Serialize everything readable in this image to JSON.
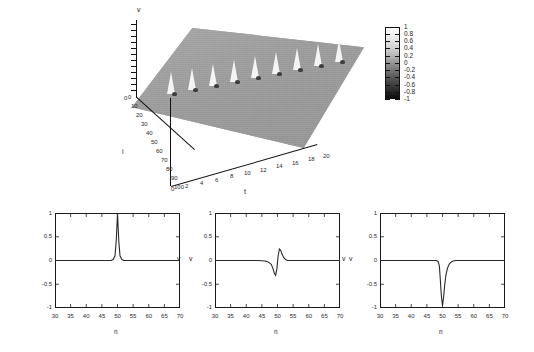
{
  "figure": {
    "kind": "soliton-simulation-figure",
    "background": "#ffffff",
    "line_color": "#2a2a2a",
    "surface_color": "#9e9e9e",
    "spike_color": "#f4f4f4"
  },
  "surface_plot": {
    "zlabel": "v",
    "xlabel": "t",
    "ylabel": "i",
    "t_ticks": [
      "0",
      "2",
      "4",
      "6",
      "8",
      "10",
      "12",
      "14",
      "16",
      "18",
      "20"
    ],
    "i_ticks": [
      "0",
      "10",
      "20",
      "30",
      "40",
      "50",
      "60",
      "70",
      "80",
      "90",
      "100"
    ],
    "v_origin_tick": "0",
    "spike_count": 9,
    "zero_label": "0"
  },
  "colorbar": {
    "labels": [
      "1",
      "0.8",
      "0.6",
      "0.4",
      "0.2",
      "0",
      "-0.2",
      "-0.4",
      "-0.6",
      "-0.8",
      "-1"
    ],
    "max": 1,
    "min": -1,
    "top_color": "#ffffff",
    "bottom_color": "#0d0d0d"
  },
  "chart_data": [
    {
      "type": "line",
      "title": "",
      "xlabel": "n",
      "ylabel": "v",
      "xlim": [
        30,
        70
      ],
      "ylim": [
        -1,
        1
      ],
      "xticks": [
        "30",
        "35",
        "40",
        "45",
        "50",
        "55",
        "60",
        "65",
        "70"
      ],
      "yticks": [
        "1",
        "0.5",
        "0",
        "-0.5",
        "-1"
      ],
      "grid": false,
      "legend": "none",
      "series": [
        {
          "name": "v(n)",
          "x": [
            30,
            32,
            34,
            36,
            38,
            40,
            42,
            44,
            45,
            46,
            47,
            48,
            48.6,
            49.2,
            49.6,
            50,
            50.4,
            50.8,
            51.4,
            52,
            53,
            54,
            56,
            58,
            60,
            62,
            64,
            66,
            68,
            70
          ],
          "values": [
            0,
            0,
            0,
            0,
            0,
            0,
            0,
            0,
            0,
            0,
            0,
            0,
            0.02,
            0.1,
            0.42,
            1.0,
            0.42,
            0.1,
            0.02,
            0,
            0,
            0,
            0,
            0,
            0,
            0,
            0,
            0,
            0,
            0
          ]
        }
      ]
    },
    {
      "type": "line",
      "title": "",
      "xlabel": "n",
      "ylabel": "v",
      "xlim": [
        30,
        70
      ],
      "ylim": [
        -1,
        1
      ],
      "xticks": [
        "30",
        "35",
        "40",
        "45",
        "50",
        "55",
        "60",
        "65",
        "70"
      ],
      "yticks": [
        "1",
        "0.5",
        "0",
        "-0.5",
        "-1"
      ],
      "grid": false,
      "legend": "none",
      "series": [
        {
          "name": "v(n)",
          "x": [
            30,
            34,
            38,
            42,
            44,
            46,
            47,
            48,
            48.5,
            49,
            49.4,
            49.8,
            50.2,
            50.6,
            51,
            51.4,
            52,
            52.6,
            53.2,
            54,
            56,
            58,
            62,
            66,
            70
          ],
          "values": [
            0,
            0,
            0,
            0,
            0,
            -0.01,
            -0.03,
            -0.08,
            -0.16,
            -0.27,
            -0.31,
            -0.18,
            0.1,
            0.24,
            0.22,
            0.14,
            0.06,
            0.02,
            0.0,
            0,
            0,
            0,
            0,
            0,
            0
          ]
        }
      ]
    },
    {
      "type": "line",
      "title": "",
      "xlabel": "n",
      "ylabel": "v",
      "xlim": [
        30,
        70
      ],
      "ylim": [
        -1,
        1
      ],
      "xticks": [
        "30",
        "35",
        "40",
        "45",
        "50",
        "55",
        "60",
        "65",
        "70"
      ],
      "yticks": [
        "1",
        "0.5",
        "0",
        "-0.5",
        "-1"
      ],
      "grid": false,
      "legend": "none",
      "series": [
        {
          "name": "v(n)",
          "x": [
            30,
            34,
            38,
            42,
            45,
            47,
            48,
            48.6,
            49,
            49.3,
            49.6,
            50,
            50.3,
            50.7,
            51.1,
            51.6,
            52.2,
            53,
            54,
            56,
            60,
            64,
            68,
            70
          ],
          "values": [
            0,
            0,
            0,
            0,
            0,
            0,
            0,
            -0.02,
            -0.12,
            -0.4,
            -0.72,
            -0.95,
            -0.8,
            -0.52,
            -0.3,
            -0.16,
            -0.07,
            -0.02,
            0,
            0,
            0,
            0,
            0,
            0
          ]
        }
      ]
    }
  ]
}
